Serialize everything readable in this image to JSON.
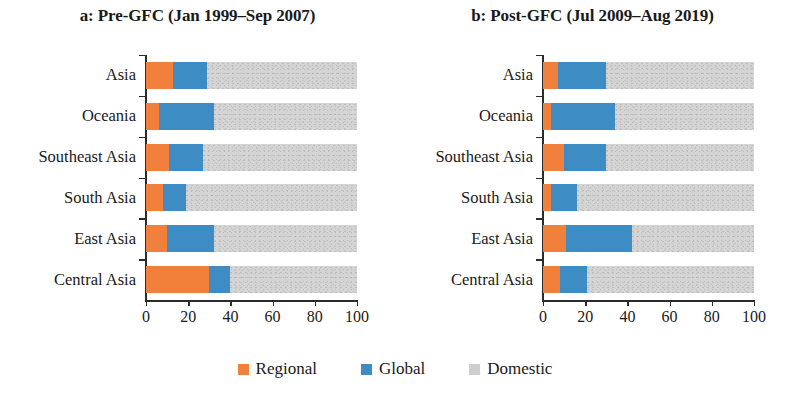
{
  "chart_data": [
    {
      "type": "bar",
      "id": "pre-gfc",
      "title": "a: Pre-GFC (Jan 1999–Sep 2007)",
      "xlabel": "",
      "ylabel": "",
      "xlim": [
        0,
        100
      ],
      "xticks": [
        0,
        20,
        40,
        60,
        80,
        100
      ],
      "xticklabels": [
        "0",
        "20",
        "40",
        "60",
        "80",
        "100"
      ],
      "grid": false,
      "orientation": "horizontal",
      "stacked": true,
      "stack_total": 100,
      "legend_position": "bottom-center",
      "categories": [
        "Asia",
        "Oceania",
        "Southeast Asia",
        "South Asia",
        "East Asia",
        "Central Asia"
      ],
      "series": [
        {
          "name": "Regional",
          "color": "#f0803c",
          "values": [
            13,
            6,
            11,
            8,
            10,
            30
          ]
        },
        {
          "name": "Global",
          "color": "#3d8dc4",
          "values": [
            16,
            26,
            16,
            11,
            22,
            10
          ]
        },
        {
          "name": "Domestic",
          "color": "#d4d4d4",
          "values": [
            71,
            68,
            73,
            81,
            68,
            60
          ]
        }
      ]
    },
    {
      "type": "bar",
      "id": "post-gfc",
      "title": "b: Post-GFC (Jul 2009–Aug 2019)",
      "xlabel": "",
      "ylabel": "",
      "xlim": [
        0,
        100
      ],
      "xticks": [
        0,
        20,
        40,
        60,
        80,
        100
      ],
      "xticklabels": [
        "0",
        "20",
        "40",
        "60",
        "80",
        "100"
      ],
      "grid": false,
      "orientation": "horizontal",
      "stacked": true,
      "stack_total": 100,
      "legend_position": "bottom-center",
      "categories": [
        "Asia",
        "Oceania",
        "Southeast Asia",
        "South Asia",
        "East Asia",
        "Central Asia"
      ],
      "series": [
        {
          "name": "Regional",
          "color": "#f0803c",
          "values": [
            7,
            4,
            10,
            4,
            11,
            8
          ]
        },
        {
          "name": "Global",
          "color": "#3d8dc4",
          "values": [
            23,
            30,
            20,
            12,
            31,
            13
          ]
        },
        {
          "name": "Domestic",
          "color": "#d4d4d4",
          "values": [
            70,
            66,
            70,
            84,
            58,
            79
          ]
        }
      ]
    }
  ],
  "legend": {
    "items": [
      {
        "label": "Regional",
        "color": "#f0803c",
        "key": "regional"
      },
      {
        "label": "Global",
        "color": "#3d8dc4",
        "key": "global"
      },
      {
        "label": "Domestic",
        "color": "#cfcfcf",
        "key": "domestic"
      }
    ]
  },
  "colors": {
    "regional": "#f0803c",
    "global": "#3d8dc4",
    "domestic": "#d4d4d4",
    "axis": "#2b2b2b",
    "text": "#1a1a1a",
    "background": "#ffffff"
  }
}
